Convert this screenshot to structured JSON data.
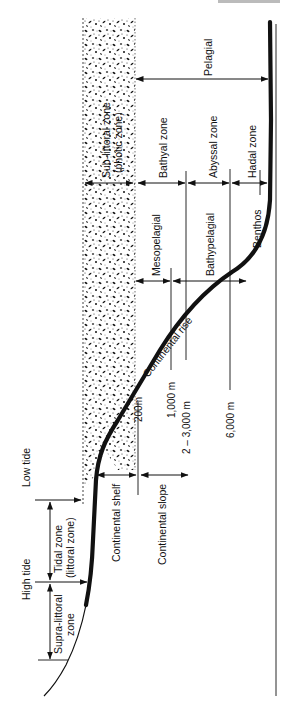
{
  "header_fragment": "...",
  "diagram": {
    "regions": {
      "photic": {
        "label_line1": "Sub-littoral zone",
        "label_line2": "(photic zone)"
      },
      "pelagial": {
        "label": "Pelagial"
      },
      "bathyal": {
        "label": "Bathyal zone"
      },
      "abyssal": {
        "label": "Abyssal zone"
      },
      "hadal": {
        "label": "Hadal zone"
      },
      "mesopelagial": {
        "label": "Mesopelagial"
      },
      "bathypelagial": {
        "label": "Bathypelagial"
      },
      "benthos": {
        "label": "Benthos"
      },
      "continental_rise": {
        "label": "Continental rise"
      },
      "continental_shelf": {
        "label": "Continental shelf"
      },
      "continental_slope": {
        "label": "Continental slope"
      },
      "tidal": {
        "label_line1": "Tidal zone",
        "label_line2": "(littoral zone)"
      },
      "supra_littoral": {
        "label_line1": "Supra-littoral",
        "label_line2": "zone"
      }
    },
    "tide_marks": {
      "low": "Low tide",
      "high": "High tide"
    },
    "depths": [
      {
        "label": "200m"
      },
      {
        "label": "1,000 m"
      },
      {
        "label": "2 – 3,000 m"
      },
      {
        "label": "6,000 m"
      }
    ],
    "colors": {
      "ink": "#111111",
      "background": "#ffffff"
    }
  }
}
